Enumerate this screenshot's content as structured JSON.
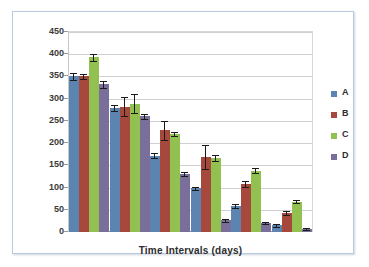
{
  "chart_data": {
    "type": "bar",
    "title": "",
    "xlabel": "Time Intervals (days)",
    "ylabel": "",
    "categories": [
      "1",
      "2",
      "3",
      "4",
      "5",
      "6"
    ],
    "ylim": [
      0,
      450
    ],
    "ytick_step": 50,
    "yticks": [
      0,
      50,
      100,
      150,
      200,
      250,
      300,
      350,
      400,
      450
    ],
    "ytick_labels": [
      "0",
      "50",
      "100",
      "150",
      "200",
      "250",
      "300",
      "350",
      "400",
      "450"
    ],
    "grid": true,
    "legend_position": "right",
    "series": [
      {
        "name": "A",
        "color": "#5b84b1",
        "values": [
          350,
          279,
          172,
          98,
          58,
          15
        ],
        "errors": [
          7,
          6,
          5,
          4,
          4,
          3
        ]
      },
      {
        "name": "B",
        "color": "#a6493c",
        "values": [
          350,
          282,
          229,
          169,
          108,
          43
        ],
        "errors": [
          6,
          21,
          21,
          27,
          6,
          4
        ]
      },
      {
        "name": "C",
        "color": "#92c051",
        "values": [
          393,
          289,
          220,
          166,
          138,
          68
        ],
        "errors": [
          8,
          22,
          5,
          7,
          5,
          3
        ]
      },
      {
        "name": "D",
        "color": "#7a6f9b",
        "values": [
          332,
          260,
          130,
          26,
          20,
          7
        ],
        "errors": [
          7,
          5,
          4,
          4,
          3,
          2
        ]
      }
    ]
  },
  "legend": {
    "entries": [
      {
        "label": "A"
      },
      {
        "label": "B"
      },
      {
        "label": "C"
      },
      {
        "label": "D"
      }
    ]
  },
  "axis": {
    "x_title": "Time Intervals (days)"
  },
  "colors": {
    "series_a": "#5b84b1",
    "series_b": "#a6493c",
    "series_c": "#92c051",
    "series_d": "#7a6f9b",
    "gridline": "#d0d0d0",
    "frame_border": "#b6cbe2",
    "plot_background": "#ffffff",
    "error_bar": "#1a1a1a"
  }
}
